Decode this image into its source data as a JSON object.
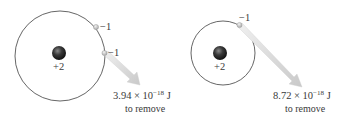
{
  "left_atom": {
    "nucleus_charge": "+2",
    "electron_1_charge": "−1",
    "electron_2_charge": "−1",
    "energy_mantissa": "3.94 × 10",
    "energy_exponent": "−18",
    "energy_unit": " J",
    "energy_caption": "to remove"
  },
  "right_atom": {
    "nucleus_charge": "+2",
    "electron_1_charge": "−1",
    "energy_mantissa": "8.72 × 10",
    "energy_exponent": "−18",
    "energy_unit": " J",
    "energy_caption": "to remove"
  },
  "colors": {
    "orbit": "#555555",
    "nucleus": "#2a2a2a",
    "electron": "#c8c8c8",
    "arrow": "#d6d6d6"
  }
}
